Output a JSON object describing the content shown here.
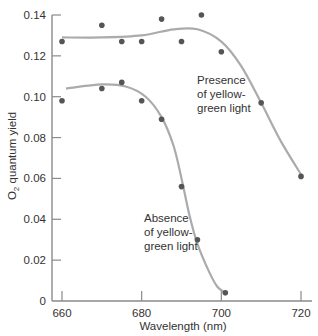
{
  "chart_data": {
    "type": "scatter",
    "title": "",
    "xlabel": "Wavelength (nm)",
    "ylabel_main": "O",
    "ylabel_sub": "2",
    "ylabel_rest": " quantum yield",
    "xlim": [
      660,
      720
    ],
    "ylim": [
      0,
      0.14
    ],
    "xticks": [
      660,
      680,
      700,
      720
    ],
    "xtick_labels": [
      "660",
      "680",
      "700",
      "720"
    ],
    "yticks": [
      0,
      0.02,
      0.04,
      0.06,
      0.08,
      0.1,
      0.12,
      0.14
    ],
    "ytick_labels": [
      "0",
      "0.02",
      "0.04",
      "0.06",
      "0.08",
      "0.10",
      "0.12",
      "0.14"
    ],
    "grid": false,
    "legend": "none (inline annotations)",
    "series": [
      {
        "name": "Presence of yellow-green light",
        "annotation_lines": [
          "Presence",
          "of yellow-",
          "green light"
        ],
        "points": [
          {
            "x": 660,
            "y": 0.127
          },
          {
            "x": 670,
            "y": 0.135
          },
          {
            "x": 675,
            "y": 0.127
          },
          {
            "x": 680,
            "y": 0.127
          },
          {
            "x": 685,
            "y": 0.138
          },
          {
            "x": 690,
            "y": 0.127
          },
          {
            "x": 695,
            "y": 0.14
          },
          {
            "x": 700,
            "y": 0.122
          },
          {
            "x": 710,
            "y": 0.097
          },
          {
            "x": 720,
            "y": 0.061
          }
        ],
        "curve": [
          {
            "x": 660,
            "y": 0.129
          },
          {
            "x": 670,
            "y": 0.129
          },
          {
            "x": 680,
            "y": 0.13
          },
          {
            "x": 688,
            "y": 0.133
          },
          {
            "x": 694,
            "y": 0.133
          },
          {
            "x": 700,
            "y": 0.127
          },
          {
            "x": 705,
            "y": 0.115
          },
          {
            "x": 710,
            "y": 0.097
          },
          {
            "x": 715,
            "y": 0.078
          },
          {
            "x": 720,
            "y": 0.062
          }
        ]
      },
      {
        "name": "Absence of yellow-green light",
        "annotation_lines": [
          "Absence",
          "of yellow-",
          "green light"
        ],
        "points": [
          {
            "x": 660,
            "y": 0.098
          },
          {
            "x": 670,
            "y": 0.104
          },
          {
            "x": 675,
            "y": 0.107
          },
          {
            "x": 680,
            "y": 0.098
          },
          {
            "x": 685,
            "y": 0.089
          },
          {
            "x": 690,
            "y": 0.056
          },
          {
            "x": 694,
            "y": 0.03
          },
          {
            "x": 701,
            "y": 0.004
          }
        ],
        "curve": [
          {
            "x": 661,
            "y": 0.104
          },
          {
            "x": 670,
            "y": 0.106
          },
          {
            "x": 676,
            "y": 0.105
          },
          {
            "x": 681,
            "y": 0.1
          },
          {
            "x": 685,
            "y": 0.09
          },
          {
            "x": 688,
            "y": 0.076
          },
          {
            "x": 690,
            "y": 0.06
          },
          {
            "x": 692,
            "y": 0.042
          },
          {
            "x": 694,
            "y": 0.028
          },
          {
            "x": 697,
            "y": 0.014
          },
          {
            "x": 699,
            "y": 0.007
          },
          {
            "x": 701,
            "y": 0.004
          }
        ]
      }
    ]
  },
  "colors": {
    "axis": "#8a8a8a",
    "curve": "#ababab",
    "point": "#555555",
    "text": "#333333"
  }
}
